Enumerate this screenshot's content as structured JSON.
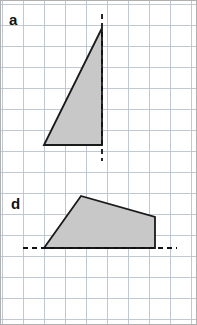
{
  "figure": {
    "width": 197,
    "height": 325,
    "background_color": "#ffffff",
    "border_color": "#b0b0b0"
  },
  "grid": {
    "cell_size": 21,
    "origin_x": 2,
    "origin_y": 4,
    "columns": 9,
    "rows": 15,
    "line_color": "#b9c2cf",
    "line_width": 0.9
  },
  "style": {
    "shape_fill": "#c8c8c8",
    "shape_stroke": "#1a1a1a",
    "shape_stroke_width": 1.8,
    "dash_color": "#111111",
    "dash_width": 1.8,
    "dash_pattern": "5,4",
    "label_color": "#111111"
  },
  "panels": [
    {
      "id": "panel-a",
      "label": "a",
      "label_x": 9,
      "label_y": 12,
      "shape_type": "triangle",
      "points": "44,145 102,28 102,145",
      "vertices": [
        {
          "x": 44,
          "y": 145
        },
        {
          "x": 102,
          "y": 28
        },
        {
          "x": 102,
          "y": 145
        }
      ],
      "mirror_line": {
        "orientation": "vertical",
        "x1": 102,
        "y1": 14,
        "x2": 102,
        "y2": 161
      }
    },
    {
      "id": "panel-d",
      "label": "d",
      "label_x": 11,
      "label_y": 196,
      "shape_type": "quadrilateral",
      "points": "44,248 81,196 155,217 155,248",
      "vertices": [
        {
          "x": 44,
          "y": 248
        },
        {
          "x": 81,
          "y": 196
        },
        {
          "x": 155,
          "y": 217
        },
        {
          "x": 155,
          "y": 248
        }
      ],
      "mirror_line": {
        "orientation": "horizontal",
        "x1": 23,
        "y1": 248,
        "x2": 177,
        "y2": 248
      }
    }
  ]
}
